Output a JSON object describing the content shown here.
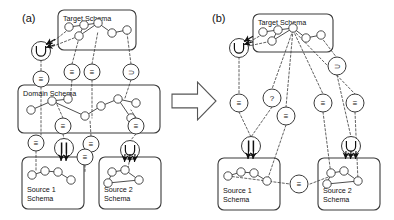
{
  "figure": {
    "width": 394,
    "height": 220,
    "background": "#ffffff",
    "stroke": "#3a3a3a",
    "node_fill": "#ffffff"
  },
  "panels": [
    {
      "id": "a",
      "label": "(a)",
      "x": 22,
      "y": 22
    },
    {
      "id": "b",
      "label": "(b)",
      "x": 212,
      "y": 22
    }
  ],
  "transition_arrow": {
    "name": "big-right-arrow",
    "x": 172,
    "y": 82,
    "width": 44,
    "height": 38
  },
  "boxes": [
    {
      "id": "a-target",
      "label": "Target Schema",
      "label_lines": [
        "Target Schema"
      ],
      "x": 58,
      "y": 10,
      "w": 78,
      "h": 40
    },
    {
      "id": "a-domain",
      "label": "Domain Schema",
      "label_lines": [
        "Domain Schema"
      ],
      "x": 18,
      "y": 85,
      "w": 142,
      "h": 48
    },
    {
      "id": "a-source1",
      "label": "Source 1 Schema",
      "label_lines": [
        "Source 1",
        "Schema"
      ],
      "x": 22,
      "y": 157,
      "w": 62,
      "h": 52
    },
    {
      "id": "a-source2",
      "label": "Source 2 Schema",
      "label_lines": [
        "Source 2",
        "Schema"
      ],
      "x": 99,
      "y": 157,
      "w": 62,
      "h": 52
    },
    {
      "id": "b-target",
      "label": "Target Schema",
      "label_lines": [
        "Target Schema"
      ],
      "x": 253,
      "y": 14,
      "w": 80,
      "h": 38
    },
    {
      "id": "b-source1",
      "label": "Source 1 Schema",
      "label_lines": [
        "Source 1",
        "Schema"
      ],
      "x": 218,
      "y": 158,
      "w": 62,
      "h": 52
    },
    {
      "id": "b-source2",
      "label": "Source 2 Schema",
      "label_lines": [
        "Source 2",
        "Schema"
      ],
      "x": 318,
      "y": 158,
      "w": 62,
      "h": 52
    }
  ],
  "operators": {
    "glyph_names": {
      "equivalence": "triple-bar-equivalence-icon",
      "superset": "superset-icon",
      "union": "union-icon",
      "parallel": "parallel-bars-icon",
      "unknown": "question-mark-icon"
    },
    "items": [
      {
        "id": "a-op-union",
        "panel": "a",
        "glyph": "U",
        "kind": "union",
        "x": 41,
        "y": 51,
        "r": 9.5
      },
      {
        "id": "a-op-eq-1",
        "panel": "a",
        "glyph": "≡",
        "kind": "equivalence",
        "x": 41,
        "y": 79,
        "r": 8
      },
      {
        "id": "a-op-eq-2",
        "panel": "a",
        "glyph": "≡",
        "kind": "equivalence",
        "x": 72,
        "y": 72,
        "r": 8
      },
      {
        "id": "a-op-eq-3",
        "panel": "a",
        "glyph": "≡",
        "kind": "equivalence",
        "x": 92,
        "y": 72,
        "r": 8
      },
      {
        "id": "a-op-sup-1",
        "panel": "a",
        "glyph": "⊃",
        "kind": "superset",
        "x": 131,
        "y": 72,
        "r": 8
      },
      {
        "id": "a-op-eq-4",
        "panel": "a",
        "glyph": "≡",
        "kind": "equivalence",
        "x": 63,
        "y": 126,
        "r": 8
      },
      {
        "id": "a-op-eq-5",
        "panel": "a",
        "glyph": "≡",
        "kind": "equivalence",
        "x": 136,
        "y": 126,
        "r": 8
      },
      {
        "id": "a-op-eq-6",
        "panel": "a",
        "glyph": "≡",
        "kind": "equivalence",
        "x": 36,
        "y": 143,
        "r": 8
      },
      {
        "id": "a-op-par-1",
        "panel": "a",
        "glyph": "||",
        "kind": "parallel",
        "x": 64,
        "y": 148,
        "r": 9.5
      },
      {
        "id": "a-op-eq-7",
        "panel": "a",
        "glyph": "≡",
        "kind": "equivalence",
        "x": 91,
        "y": 144,
        "r": 8
      },
      {
        "id": "a-op-eq-8",
        "panel": "a",
        "glyph": "≡",
        "kind": "equivalence",
        "x": 85,
        "y": 157,
        "r": 8
      },
      {
        "id": "a-op-union-2",
        "panel": "a",
        "glyph": "U",
        "kind": "union",
        "x": 130,
        "y": 150,
        "r": 9.5
      },
      {
        "id": "b-op-union",
        "panel": "b",
        "glyph": "U",
        "kind": "union",
        "x": 239,
        "y": 48,
        "r": 9.5
      },
      {
        "id": "b-op-sup-1",
        "panel": "b",
        "glyph": "⊃",
        "kind": "superset",
        "x": 337,
        "y": 66,
        "r": 9
      },
      {
        "id": "b-op-eq-1",
        "panel": "b",
        "glyph": "≡",
        "kind": "equivalence",
        "x": 239,
        "y": 103,
        "r": 9
      },
      {
        "id": "b-op-unk",
        "panel": "b",
        "glyph": "?",
        "kind": "unknown",
        "x": 272,
        "y": 98,
        "r": 9
      },
      {
        "id": "b-op-eq-2",
        "panel": "b",
        "glyph": "≡",
        "kind": "equivalence",
        "x": 286,
        "y": 116,
        "r": 9
      },
      {
        "id": "b-op-eq-3",
        "panel": "b",
        "glyph": "≡",
        "kind": "equivalence",
        "x": 323,
        "y": 103,
        "r": 9
      },
      {
        "id": "b-op-eq-4",
        "panel": "b",
        "glyph": "≡",
        "kind": "equivalence",
        "x": 355,
        "y": 103,
        "r": 9
      },
      {
        "id": "b-op-par-1",
        "panel": "b",
        "glyph": "||",
        "kind": "parallel",
        "x": 251,
        "y": 146,
        "r": 9.5
      },
      {
        "id": "b-op-union-2",
        "panel": "b",
        "glyph": "U",
        "kind": "union",
        "x": 351,
        "y": 146,
        "r": 9.5
      },
      {
        "id": "b-op-eq-mid",
        "panel": "b",
        "glyph": "≡",
        "kind": "equivalence",
        "x": 299,
        "y": 184,
        "r": 9
      }
    ]
  },
  "schema_graphs": {
    "a_target": {
      "nodes": [
        [
          69,
          27
        ],
        [
          84,
          25
        ],
        [
          98,
          23
        ],
        [
          79,
          36
        ],
        [
          112,
          33
        ],
        [
          127,
          30
        ]
      ],
      "edges": [
        [
          0,
          1
        ],
        [
          1,
          2
        ],
        [
          2,
          4
        ],
        [
          4,
          5
        ],
        [
          1,
          3
        ],
        [
          2,
          3
        ]
      ]
    },
    "a_domain": {
      "nodes": [
        [
          31,
          110
        ],
        [
          52,
          101
        ],
        [
          68,
          99
        ],
        [
          85,
          116
        ],
        [
          101,
          106
        ],
        [
          118,
          99
        ],
        [
          136,
          103
        ],
        [
          131,
          118
        ]
      ],
      "edges": [
        [
          0,
          1
        ],
        [
          1,
          2
        ],
        [
          1,
          3
        ],
        [
          3,
          4
        ],
        [
          4,
          5
        ],
        [
          5,
          6
        ],
        [
          5,
          7
        ]
      ]
    },
    "a_source1": {
      "nodes": [
        [
          32,
          175
        ],
        [
          45,
          171
        ],
        [
          58,
          172
        ],
        [
          71,
          180
        ]
      ],
      "edges": [
        [
          0,
          1
        ],
        [
          1,
          2
        ],
        [
          2,
          3
        ]
      ]
    },
    "a_source2": {
      "nodes": [
        [
          112,
          172
        ],
        [
          125,
          170
        ],
        [
          108,
          183
        ],
        [
          139,
          180
        ]
      ],
      "edges": [
        [
          0,
          1
        ],
        [
          0,
          2
        ],
        [
          1,
          3
        ],
        [
          2,
          3
        ]
      ]
    },
    "b_target": {
      "nodes": [
        [
          263,
          32
        ],
        [
          278,
          30
        ],
        [
          293,
          28
        ],
        [
          272,
          41
        ],
        [
          306,
          38
        ],
        [
          321,
          35
        ]
      ],
      "edges": [
        [
          0,
          1
        ],
        [
          1,
          2
        ],
        [
          2,
          4
        ],
        [
          4,
          5
        ],
        [
          1,
          3
        ],
        [
          2,
          3
        ]
      ]
    },
    "b_source1": {
      "nodes": [
        [
          228,
          176
        ],
        [
          241,
          172
        ],
        [
          254,
          173
        ],
        [
          267,
          181
        ]
      ],
      "edges": [
        [
          0,
          1
        ],
        [
          1,
          2
        ],
        [
          2,
          3
        ]
      ]
    },
    "b_source2": {
      "nodes": [
        [
          331,
          173
        ],
        [
          344,
          171
        ],
        [
          327,
          184
        ],
        [
          358,
          181
        ]
      ],
      "edges": [
        [
          0,
          1
        ],
        [
          0,
          2
        ],
        [
          1,
          3
        ],
        [
          2,
          3
        ]
      ]
    }
  },
  "mapping_links": {
    "description": "dashed correspondence lines between operator circles and schema elements",
    "panel_a": [
      [
        41,
        51,
        69,
        29
      ],
      [
        41,
        51,
        79,
        36
      ],
      [
        41,
        60,
        41,
        71
      ],
      [
        41,
        87,
        41,
        135
      ],
      [
        72,
        64,
        79,
        38
      ],
      [
        72,
        80,
        70,
        100
      ],
      [
        92,
        64,
        98,
        31
      ],
      [
        92,
        80,
        92,
        118
      ],
      [
        131,
        64,
        127,
        33
      ],
      [
        131,
        80,
        125,
        98
      ],
      [
        63,
        118,
        55,
        100
      ],
      [
        63,
        134,
        64,
        139
      ],
      [
        136,
        118,
        131,
        110
      ],
      [
        136,
        134,
        130,
        141
      ],
      [
        36,
        151,
        36,
        172
      ],
      [
        91,
        136,
        90,
        120
      ],
      [
        85,
        165,
        85,
        172
      ],
      [
        130,
        158,
        128,
        168
      ]
    ],
    "panel_b": [
      [
        239,
        48,
        263,
        34
      ],
      [
        239,
        48,
        272,
        41
      ],
      [
        239,
        57,
        239,
        94
      ],
      [
        239,
        112,
        251,
        137
      ],
      [
        293,
        30,
        272,
        89
      ],
      [
        293,
        30,
        286,
        107
      ],
      [
        293,
        30,
        323,
        94
      ],
      [
        293,
        30,
        355,
        94
      ],
      [
        321,
        37,
        337,
        58
      ],
      [
        337,
        75,
        351,
        137
      ],
      [
        272,
        107,
        251,
        137
      ],
      [
        286,
        125,
        267,
        181
      ],
      [
        323,
        112,
        331,
        175
      ],
      [
        355,
        112,
        358,
        181
      ],
      [
        228,
        176,
        290,
        184
      ],
      [
        310,
        184,
        331,
        176
      ]
    ]
  },
  "arrow_clusters": [
    {
      "id": "a-union-in",
      "x": 41,
      "y": 47,
      "count": 2,
      "dir": "left"
    },
    {
      "id": "a-par-arrows",
      "x": 64,
      "y": 160,
      "count": 2,
      "dir": "down"
    },
    {
      "id": "a-union2-arrows",
      "x": 130,
      "y": 161,
      "count": 3,
      "dir": "down"
    },
    {
      "id": "b-union-in",
      "x": 239,
      "y": 44,
      "count": 2,
      "dir": "left"
    },
    {
      "id": "b-par-arrows",
      "x": 251,
      "y": 158,
      "count": 2,
      "dir": "down"
    },
    {
      "id": "b-union2-arrows",
      "x": 351,
      "y": 158,
      "count": 3,
      "dir": "down"
    }
  ]
}
